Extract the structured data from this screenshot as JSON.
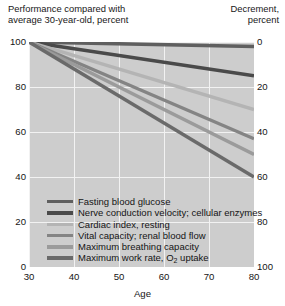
{
  "header": {
    "left_caption": "Performance compared with average 30-year-old, percent",
    "left_line1": "Performance compared with",
    "left_line2": "average 30-year-old, percent",
    "right_line1": "Decrement,",
    "right_line2": "percent"
  },
  "chart_data": {
    "type": "line",
    "title": "",
    "xlabel": "Age",
    "ylabel": "Performance compared with average 30-year-old, percent",
    "y2label": "Decrement, percent",
    "xlim": [
      30,
      80
    ],
    "ylim": [
      0,
      100
    ],
    "y2lim": [
      0,
      100
    ],
    "grid": true,
    "legend_position": "inside-bottom-left",
    "xticks": [
      30,
      40,
      50,
      60,
      70,
      80
    ],
    "xtick_labels": [
      "30",
      "40",
      "50",
      "60",
      "70",
      "80"
    ],
    "yticks": [
      0,
      20,
      40,
      60,
      80,
      100
    ],
    "ytick_labels": [
      "0",
      "20",
      "40",
      "60",
      "80",
      "100"
    ],
    "y2ticks": [
      0,
      20,
      40,
      60,
      80,
      100
    ],
    "y2tick_labels": [
      "100",
      "80",
      "60",
      "40",
      "20",
      "0"
    ],
    "x": [
      30,
      80
    ],
    "series": [
      {
        "name": "Fasting blood glucose",
        "values": [
          100,
          98
        ],
        "decrement_at_80": 2,
        "color": "#5f5f5f"
      },
      {
        "name": "Nerve conduction velocity; cellular enzymes",
        "values": [
          100,
          85
        ],
        "decrement_at_80": 15,
        "color": "#4a4a4a"
      },
      {
        "name": "Cardiac index, resting",
        "values": [
          100,
          70
        ],
        "decrement_at_80": 30,
        "color": "#b4b4b4"
      },
      {
        "name": "Vital capacity; renal blood flow",
        "values": [
          100,
          57
        ],
        "decrement_at_80": 43,
        "color": "#848484"
      },
      {
        "name": "Maximum breathing capacity",
        "values": [
          100,
          50
        ],
        "decrement_at_80": 50,
        "color": "#9b9b9b"
      },
      {
        "name": "Maximum work rate, O2 uptake",
        "values": [
          100,
          40
        ],
        "decrement_at_80": 60,
        "color": "#6a6a6a"
      }
    ]
  },
  "legend": {
    "items": [
      {
        "label": "Fasting blood glucose",
        "sub": ""
      },
      {
        "label": "Nerve conduction velocity; cellular enzymes",
        "sub": ""
      },
      {
        "label": "Cardiac index, resting",
        "sub": ""
      },
      {
        "label": "Vital capacity; renal blood flow",
        "sub": ""
      },
      {
        "label": "Maximum breathing capacity",
        "sub": ""
      },
      {
        "label": "Maximum work rate, O",
        "sub": "2",
        "label_tail": " uptake"
      }
    ]
  },
  "colors": {
    "plot_background": "#cdcdcd",
    "gridline": "#f2f2f2",
    "text": "#141414",
    "page_background": "#ffffff"
  }
}
